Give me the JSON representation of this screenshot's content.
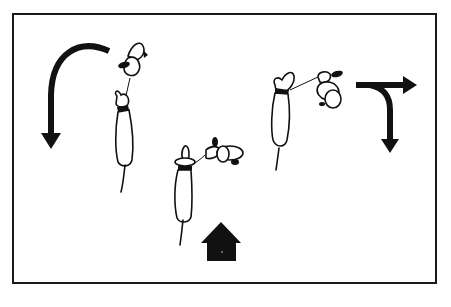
{
  "figure": {
    "colors": {
      "ink": "#111111",
      "background": "#ffffff",
      "frame": "#1a1a1a"
    },
    "scenes": [
      {
        "id": "left",
        "label": "",
        "cue": "u-turn-arrow"
      },
      {
        "id": "center",
        "label": "",
        "cue": "house-arrow"
      },
      {
        "id": "right",
        "label": "",
        "cue": "t-junction-arrow"
      }
    ],
    "icons": [
      "u-turn-arrow-icon",
      "house-up-arrow-icon",
      "t-junction-arrow-icon",
      "dog-icon",
      "handler-icon",
      "leash-icon"
    ]
  }
}
